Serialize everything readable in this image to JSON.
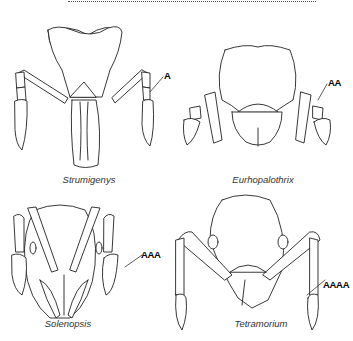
{
  "figure": {
    "panels": [
      {
        "genus": "Strumigenys",
        "label": "A"
      },
      {
        "genus": "Eurhopalothrix",
        "label": "AA"
      },
      {
        "genus": "Solenopsis",
        "label": "AAA"
      },
      {
        "genus": "Tetramorium",
        "label": "AAAA"
      }
    ]
  }
}
